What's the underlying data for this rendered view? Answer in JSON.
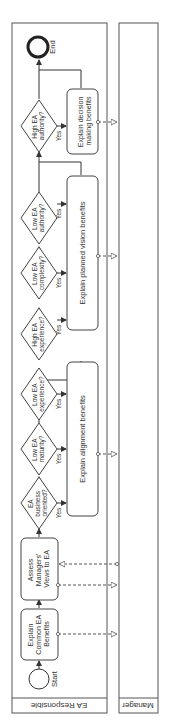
{
  "pool": {
    "lanes": [
      {
        "label": "EA Responsible"
      },
      {
        "label": "Manager"
      }
    ]
  },
  "events": {
    "start": "Start",
    "end": "End"
  },
  "tasks": [
    {
      "id": "t1",
      "lines": [
        "Explain",
        "Common EA",
        "Benefits"
      ]
    },
    {
      "id": "t2",
      "lines": [
        "Assess",
        "Managers'",
        "Views to EA"
      ]
    },
    {
      "id": "t3",
      "lines": [
        "Explain alignment benefits"
      ]
    },
    {
      "id": "t4",
      "lines": [
        "Explain planned vision benefits"
      ]
    },
    {
      "id": "t5",
      "lines": [
        "Explain decision",
        "making benefits"
      ]
    }
  ],
  "gateways": [
    {
      "id": "g1",
      "lines": [
        "EA",
        "business",
        "oriented?"
      ],
      "yes": "Yes"
    },
    {
      "id": "g2",
      "lines": [
        "Low EA",
        "maturity?"
      ],
      "yes": "Yes"
    },
    {
      "id": "g3",
      "lines": [
        "Low EA",
        "experience?"
      ],
      "yes": "Yes"
    },
    {
      "id": "g4",
      "lines": [
        "High EA",
        "experience?"
      ],
      "yes": "Yes"
    },
    {
      "id": "g5",
      "lines": [
        "Low EA",
        "complexity?"
      ],
      "yes": "Yes"
    },
    {
      "id": "g6",
      "lines": [
        "Low EA",
        "authority?"
      ],
      "yes": "Yes"
    },
    {
      "id": "g7",
      "lines": [
        "High EA",
        "authority?"
      ],
      "yes": "Yes"
    }
  ]
}
